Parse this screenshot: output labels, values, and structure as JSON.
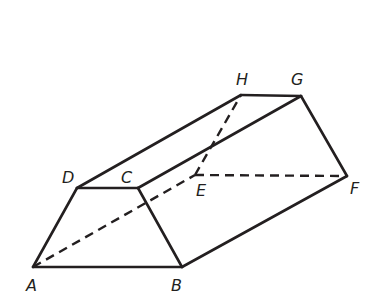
{
  "figure": {
    "vertices": {
      "A": {
        "x": 33,
        "y": 267
      },
      "B": {
        "x": 182,
        "y": 267
      },
      "C": {
        "x": 138,
        "y": 188
      },
      "D": {
        "x": 77,
        "y": 188
      },
      "E": {
        "x": 195,
        "y": 175
      },
      "F": {
        "x": 347,
        "y": 176
      },
      "G": {
        "x": 301,
        "y": 96
      },
      "H": {
        "x": 241,
        "y": 95
      }
    },
    "labels": {
      "A": {
        "text": "A",
        "x": 26,
        "y": 291
      },
      "B": {
        "text": "B",
        "x": 171,
        "y": 291
      },
      "C": {
        "text": "C",
        "x": 121,
        "y": 183
      },
      "D": {
        "text": "D",
        "x": 62,
        "y": 183
      },
      "E": {
        "text": "E",
        "x": 196,
        "y": 196
      },
      "F": {
        "text": "F",
        "x": 350,
        "y": 194
      },
      "G": {
        "text": "G",
        "x": 291,
        "y": 85
      },
      "H": {
        "text": "H",
        "x": 236,
        "y": 85
      }
    },
    "visible_edges": [
      [
        "A",
        "B"
      ],
      [
        "B",
        "C"
      ],
      [
        "C",
        "D"
      ],
      [
        "D",
        "A"
      ],
      [
        "D",
        "H"
      ],
      [
        "C",
        "G"
      ],
      [
        "B",
        "F"
      ],
      [
        "H",
        "G"
      ],
      [
        "G",
        "F"
      ]
    ],
    "hidden_edges": [
      [
        "A",
        "E"
      ],
      [
        "E",
        "F"
      ],
      [
        "E",
        "H"
      ]
    ],
    "colors": {
      "stroke": "#231f20",
      "background": "#ffffff"
    }
  }
}
